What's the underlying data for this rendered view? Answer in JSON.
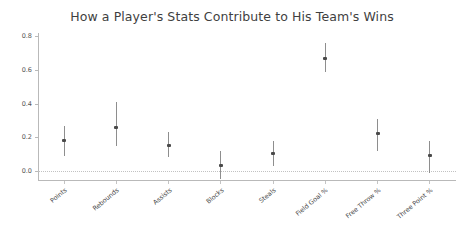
{
  "chart": {
    "title": "How a Player's Stats Contribute to His Team's Wins"
  },
  "chart_data": {
    "type": "scatter",
    "title": "How a Player's Stats Contribute to His Team's Wins",
    "xlabel": "",
    "ylabel": "",
    "ylim": [
      -0.06,
      0.82
    ],
    "yticks": [
      0.0,
      0.2,
      0.4,
      0.6,
      0.8
    ],
    "ytick_labels": [
      "0.0",
      "0.2",
      "0.4",
      "0.6",
      "0.8"
    ],
    "grid": false,
    "legend": "none",
    "zero_reference_line": 0.0,
    "categories": [
      "Points",
      "Rebounds",
      "Assists",
      "Blocks",
      "Steals",
      "Field Goal %",
      "Free Throw %",
      "Three Point %"
    ],
    "values": [
      0.18,
      0.26,
      0.15,
      0.035,
      0.105,
      0.67,
      0.22,
      0.09
    ],
    "error_low": [
      0.09,
      0.15,
      0.08,
      -0.05,
      0.03,
      0.59,
      0.12,
      -0.01
    ],
    "error_high": [
      0.27,
      0.41,
      0.23,
      0.12,
      0.18,
      0.76,
      0.31,
      0.18
    ],
    "series": [
      {
        "name": "Coefficient estimate",
        "points": [
          {
            "category": "Points",
            "value": 0.18,
            "low": 0.09,
            "high": 0.27
          },
          {
            "category": "Rebounds",
            "value": 0.26,
            "low": 0.15,
            "high": 0.41
          },
          {
            "category": "Assists",
            "value": 0.15,
            "low": 0.08,
            "high": 0.23
          },
          {
            "category": "Blocks",
            "value": 0.035,
            "low": -0.05,
            "high": 0.12
          },
          {
            "category": "Steals",
            "value": 0.105,
            "low": 0.03,
            "high": 0.18
          },
          {
            "category": "Field Goal %",
            "value": 0.67,
            "low": 0.59,
            "high": 0.76
          },
          {
            "category": "Free Throw %",
            "value": 0.22,
            "low": 0.12,
            "high": 0.31
          },
          {
            "category": "Three Point %",
            "value": 0.09,
            "low": -0.01,
            "high": 0.18
          }
        ]
      }
    ],
    "colors": {
      "marker": "#4a4a4a",
      "errorbar": "#8e8e8e",
      "axis": "#b9b9b9",
      "zero_line": "#c2c2c2",
      "text": "#4a4a4a"
    }
  }
}
